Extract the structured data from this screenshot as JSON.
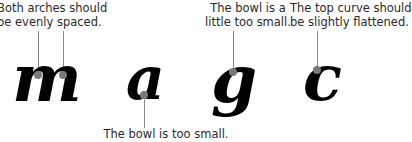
{
  "letters": [
    "m",
    "a",
    "g",
    "c"
  ],
  "annotations": {
    "m": [
      "Both arches should",
      "be evenly spaced."
    ],
    "g": [
      "The bowl is a",
      "little too small."
    ],
    "c": [
      "The top curve should",
      "be slightly flattened."
    ],
    "a": [
      "The bowl is too small."
    ]
  },
  "colors": {
    "ink": "#000000",
    "marker": "#7a7a7a",
    "leader": "#8a8a8a",
    "text": "#2a2a2a"
  }
}
